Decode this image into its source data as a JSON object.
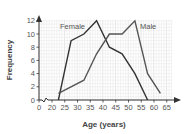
{
  "chart_data": {
    "type": "line",
    "title": "",
    "xlabel": "Age (years)",
    "ylabel": "Frequency",
    "x_ticks": [
      0,
      20,
      25,
      30,
      35,
      40,
      45,
      50,
      55,
      60,
      65
    ],
    "y_ticks": [
      0,
      2,
      4,
      6,
      8,
      10,
      12
    ],
    "xlim": [
      0,
      67
    ],
    "ylim": [
      0,
      13
    ],
    "x_axis_break": "between 0 and 20",
    "grid": true,
    "legend_position": "inline labels",
    "series": [
      {
        "name": "Female",
        "x": [
          22.5,
          27.5,
          32.5,
          37.5,
          42.5,
          47.5,
          52.5,
          57.5
        ],
        "values": [
          0,
          9,
          10,
          12,
          8,
          7,
          4,
          0
        ],
        "color": "#333333"
      },
      {
        "name": "Male",
        "x": [
          22.5,
          32.5,
          37.5,
          42.5,
          47.5,
          52.5,
          57.5,
          62.5
        ],
        "values": [
          1,
          3,
          7,
          10,
          10,
          12,
          4,
          1
        ],
        "color": "#555555"
      }
    ]
  },
  "labels": {
    "female": "Female",
    "male": "Male",
    "xlabel": "Age (years)",
    "ylabel": "Frequency"
  },
  "colors": {
    "grid_minor": "#e6e6e6",
    "grid_major": "#d2d2d2",
    "axis": "#333333"
  }
}
